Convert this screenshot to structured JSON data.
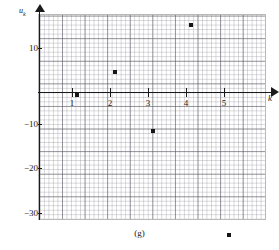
{
  "caption": "(g)",
  "chart_data": {
    "type": "scatter",
    "title": "",
    "subtitle": "",
    "xlabel": "k",
    "ylabel": "u_k",
    "ylabel_base": "u",
    "ylabel_sub": "k",
    "x": [
      1,
      2,
      3,
      4,
      5
    ],
    "values": [
      -0.5,
      4.5,
      -8.5,
      15.0,
      -31.5
    ],
    "series": [
      {
        "name": "u_k",
        "points": [
          {
            "x": 1,
            "y": -0.5
          },
          {
            "x": 2,
            "y": 4.5
          },
          {
            "x": 3,
            "y": -8.5
          },
          {
            "x": 4,
            "y": 15.0
          },
          {
            "x": 5,
            "y": -31.5
          }
        ]
      }
    ],
    "xlim": [
      0,
      6.1
    ],
    "ylim": [
      -34.5,
      17.5
    ],
    "xticks": [
      1,
      2,
      3,
      4,
      5
    ],
    "xtick_labels": [
      "1",
      "2",
      "3",
      "4",
      "5"
    ],
    "yticks": [
      10,
      -10,
      -20,
      -30
    ],
    "ytick_labels": [
      "10",
      "−10",
      "−20",
      "−30"
    ],
    "grid": true,
    "grid_minor": true,
    "legend": "none",
    "marker": "square",
    "marker_color": "#151515",
    "axis_color": "#1a1a1a",
    "grid_color": "#5a5a64"
  },
  "axes": {
    "x_arrow": true,
    "y_arrow": true
  }
}
